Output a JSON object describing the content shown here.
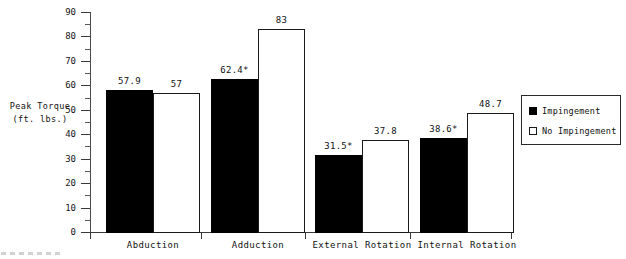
{
  "chart_data": {
    "type": "bar",
    "title": "",
    "xlabel": "",
    "ylabel": "Peak Torque (ft. lbs.)",
    "ylabel_lines": [
      "Peak Torque",
      "(ft. lbs.)"
    ],
    "ylim": [
      0,
      90
    ],
    "ytick_step": 10,
    "yminor_step": 5,
    "grid": false,
    "legend_position": "right",
    "categories": [
      "Abduction",
      "Adduction",
      "External Rotation",
      "Internal Rotation"
    ],
    "ytick_labels": [
      "0",
      "10",
      "20",
      "30",
      "40",
      "50",
      "60",
      "70",
      "80",
      "90"
    ],
    "series": [
      {
        "name": "Impingement",
        "style": "filled",
        "color": "#000000",
        "values": [
          57.9,
          62.4,
          31.5,
          38.6
        ],
        "labels": [
          "57.9",
          "62.4*",
          "31.5*",
          "38.6*"
        ]
      },
      {
        "name": "No Impingement",
        "style": "hollow",
        "color": "#ffffff",
        "values": [
          57,
          83,
          37.8,
          48.7
        ],
        "labels": [
          "57",
          "83",
          "37.8",
          "48.7"
        ]
      }
    ],
    "annotations": [
      "* denotes significance marker on Impingement bars for Adduction, External Rotation and Internal Rotation"
    ]
  },
  "legend": {
    "items": [
      {
        "label": "Impingement",
        "swatch": "filled"
      },
      {
        "label": "No Impingement",
        "swatch": "hollow"
      }
    ]
  }
}
